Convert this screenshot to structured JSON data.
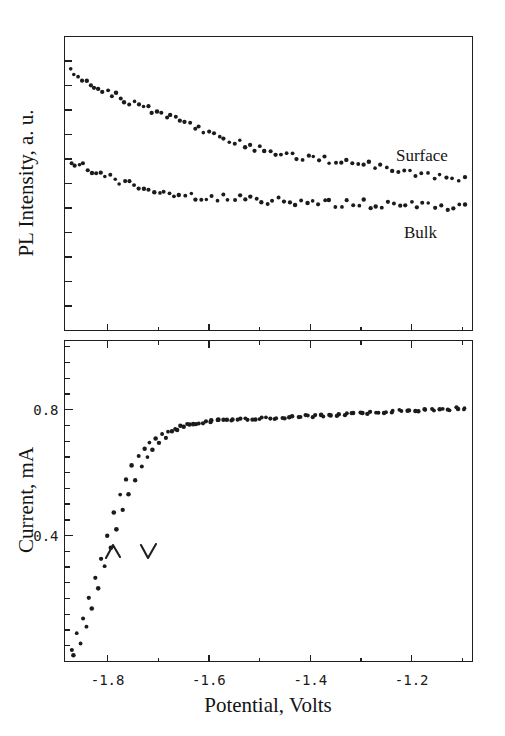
{
  "figure": {
    "background": "#ffffff",
    "ink_color": "#1b1b1b"
  },
  "panels": {
    "top": {
      "name": "PL intensity panel",
      "ylabel": "PL Intensity, a. u.",
      "series_labels": {
        "surface": "Surface",
        "bulk": "Bulk"
      },
      "y_ticks_labeled": false
    },
    "bottom": {
      "name": "Current panel",
      "ylabel": "Current, mA",
      "xlabel": "Potential, Volts",
      "y_tick_labels": [
        "0.8",
        "0.4"
      ],
      "x_tick_labels": [
        "-1.8",
        "-1.6",
        "-1.4",
        "-1.2"
      ],
      "scan_marks": {
        "forward": "∧",
        "reverse": "∨"
      }
    }
  },
  "chart_data": [
    {
      "type": "scatter",
      "title": "",
      "xlabel": "",
      "ylabel": "PL Intensity, a. u.",
      "xlim": [
        -1.885,
        -1.08
      ],
      "ylim": [
        0,
        1
      ],
      "xticks": [
        -1.8,
        -1.6,
        -1.4,
        -1.2
      ],
      "xticklabels": [
        "",
        "",
        "",
        ""
      ],
      "yticks": [],
      "yticklabels": [],
      "grid": false,
      "legend_position": "inline-annotation",
      "series": [
        {
          "name": "Surface",
          "annotation": "Surface",
          "x": [
            -1.872,
            -1.866,
            -1.858,
            -1.85,
            -1.842,
            -1.834,
            -1.826,
            -1.818,
            -1.81,
            -1.8,
            -1.792,
            -1.784,
            -1.774,
            -1.766,
            -1.756,
            -1.748,
            -1.738,
            -1.73,
            -1.72,
            -1.712,
            -1.702,
            -1.694,
            -1.684,
            -1.676,
            -1.666,
            -1.656,
            -1.648,
            -1.638,
            -1.628,
            -1.62,
            -1.61,
            -1.6,
            -1.59,
            -1.58,
            -1.57,
            -1.56,
            -1.55,
            -1.54,
            -1.53,
            -1.52,
            -1.51,
            -1.5,
            -1.49,
            -1.478,
            -1.468,
            -1.458,
            -1.448,
            -1.436,
            -1.426,
            -1.416,
            -1.404,
            -1.394,
            -1.384,
            -1.372,
            -1.362,
            -1.35,
            -1.34,
            -1.328,
            -1.318,
            -1.306,
            -1.296,
            -1.284,
            -1.272,
            -1.262,
            -1.25,
            -1.238,
            -1.226,
            -1.216,
            -1.204,
            -1.192,
            -1.18,
            -1.168,
            -1.156,
            -1.144,
            -1.132,
            -1.12,
            -1.108,
            -1.096
          ],
          "y": [
            0.88,
            0.872,
            0.868,
            0.86,
            0.848,
            0.844,
            0.836,
            0.826,
            0.818,
            0.812,
            0.806,
            0.798,
            0.79,
            0.782,
            0.778,
            0.772,
            0.766,
            0.76,
            0.754,
            0.748,
            0.742,
            0.738,
            0.73,
            0.726,
            0.72,
            0.712,
            0.706,
            0.7,
            0.694,
            0.688,
            0.68,
            0.674,
            0.668,
            0.66,
            0.654,
            0.648,
            0.642,
            0.636,
            0.632,
            0.626,
            0.62,
            0.616,
            0.612,
            0.606,
            0.602,
            0.598,
            0.596,
            0.592,
            0.59,
            0.588,
            0.586,
            0.584,
            0.582,
            0.582,
            0.58,
            0.578,
            0.578,
            0.576,
            0.574,
            0.572,
            0.568,
            0.564,
            0.56,
            0.556,
            0.552,
            0.548,
            0.544,
            0.542,
            0.538,
            0.534,
            0.53,
            0.528,
            0.524,
            0.522,
            0.518,
            0.516,
            0.514,
            0.512
          ]
        },
        {
          "name": "Bulk",
          "annotation": "Bulk",
          "x": [
            -1.872,
            -1.864,
            -1.856,
            -1.848,
            -1.84,
            -1.83,
            -1.822,
            -1.812,
            -1.804,
            -1.794,
            -1.786,
            -1.776,
            -1.766,
            -1.758,
            -1.748,
            -1.738,
            -1.728,
            -1.718,
            -1.708,
            -1.698,
            -1.688,
            -1.678,
            -1.668,
            -1.658,
            -1.648,
            -1.636,
            -1.626,
            -1.616,
            -1.604,
            -1.594,
            -1.584,
            -1.572,
            -1.562,
            -1.55,
            -1.54,
            -1.528,
            -1.518,
            -1.506,
            -1.496,
            -1.484,
            -1.474,
            -1.462,
            -1.452,
            -1.44,
            -1.43,
            -1.418,
            -1.406,
            -1.396,
            -1.384,
            -1.372,
            -1.362,
            -1.35,
            -1.338,
            -1.328,
            -1.316,
            -1.304,
            -1.294,
            -1.282,
            -1.27,
            -1.258,
            -1.248,
            -1.236,
            -1.224,
            -1.212,
            -1.2,
            -1.19,
            -1.178,
            -1.166,
            -1.154,
            -1.142,
            -1.13,
            -1.118,
            -1.106,
            -1.096
          ],
          "y": [
            0.572,
            0.566,
            0.56,
            0.556,
            0.548,
            0.544,
            0.536,
            0.53,
            0.524,
            0.52,
            0.512,
            0.508,
            0.502,
            0.498,
            0.494,
            0.49,
            0.486,
            0.482,
            0.478,
            0.474,
            0.472,
            0.468,
            0.466,
            0.462,
            0.46,
            0.458,
            0.456,
            0.454,
            0.452,
            0.452,
            0.45,
            0.45,
            0.448,
            0.448,
            0.446,
            0.446,
            0.444,
            0.444,
            0.444,
            0.442,
            0.442,
            0.442,
            0.44,
            0.44,
            0.44,
            0.438,
            0.438,
            0.438,
            0.436,
            0.436,
            0.436,
            0.434,
            0.434,
            0.434,
            0.432,
            0.432,
            0.432,
            0.43,
            0.43,
            0.43,
            0.428,
            0.428,
            0.428,
            0.426,
            0.426,
            0.426,
            0.424,
            0.424,
            0.424,
            0.422,
            0.422,
            0.422,
            0.42,
            0.42
          ]
        }
      ]
    },
    {
      "type": "scatter",
      "title": "",
      "xlabel": "Potential, Volts",
      "ylabel": "Current, mA",
      "xlim": [
        -1.885,
        -1.08
      ],
      "ylim": [
        0.0,
        1.02
      ],
      "xticks": [
        -1.8,
        -1.6,
        -1.4,
        -1.2
      ],
      "xticklabels": [
        "-1.8",
        "-1.6",
        "-1.4",
        "-1.2"
      ],
      "yticks": [
        0.4,
        0.8
      ],
      "yticklabels": [
        "0.4",
        "0.8"
      ],
      "grid": false,
      "legend_position": "none",
      "series": [
        {
          "name": "forward scan",
          "annotation": "∧",
          "x": [
            -1.872,
            -1.86,
            -1.848,
            -1.836,
            -1.824,
            -1.812,
            -1.8,
            -1.788,
            -1.776,
            -1.764,
            -1.752,
            -1.74,
            -1.728,
            -1.716,
            -1.704,
            -1.692,
            -1.68,
            -1.668,
            -1.656,
            -1.644,
            -1.632,
            -1.62,
            -1.606,
            -1.594,
            -1.58,
            -1.566,
            -1.552,
            -1.538,
            -1.524,
            -1.51,
            -1.496,
            -1.48,
            -1.466,
            -1.45,
            -1.436,
            -1.42,
            -1.406,
            -1.39,
            -1.374,
            -1.36,
            -1.344,
            -1.328,
            -1.314,
            -1.298,
            -1.282,
            -1.266,
            -1.25,
            -1.236,
            -1.22,
            -1.204,
            -1.188,
            -1.172,
            -1.156,
            -1.14,
            -1.124,
            -1.108,
            -1.096
          ],
          "y": [
            0.04,
            0.09,
            0.14,
            0.2,
            0.268,
            0.33,
            0.398,
            0.47,
            0.528,
            0.58,
            0.62,
            0.652,
            0.678,
            0.698,
            0.712,
            0.722,
            0.732,
            0.74,
            0.748,
            0.752,
            0.756,
            0.76,
            0.762,
            0.764,
            0.766,
            0.768,
            0.768,
            0.77,
            0.77,
            0.772,
            0.772,
            0.774,
            0.774,
            0.776,
            0.776,
            0.778,
            0.778,
            0.78,
            0.782,
            0.782,
            0.784,
            0.786,
            0.786,
            0.788,
            0.79,
            0.79,
            0.792,
            0.794,
            0.794,
            0.796,
            0.796,
            0.798,
            0.798,
            0.8,
            0.8,
            0.802,
            0.802
          ]
        },
        {
          "name": "reverse scan",
          "annotation": "∨",
          "x": [
            -1.866,
            -1.854,
            -1.842,
            -1.83,
            -1.818,
            -1.806,
            -1.794,
            -1.782,
            -1.77,
            -1.758,
            -1.746,
            -1.734,
            -1.722,
            -1.71,
            -1.698,
            -1.686,
            -1.674,
            -1.662,
            -1.65,
            -1.638,
            -1.626,
            -1.612,
            -1.598,
            -1.584,
            -1.57,
            -1.556,
            -1.542,
            -1.528,
            -1.514,
            -1.5,
            -1.486,
            -1.47,
            -1.456,
            -1.44,
            -1.424,
            -1.41,
            -1.394,
            -1.378,
            -1.364,
            -1.348,
            -1.332,
            -1.318,
            -1.302,
            -1.286,
            -1.27,
            -1.254,
            -1.24,
            -1.224,
            -1.208,
            -1.192,
            -1.176,
            -1.16,
            -1.144,
            -1.128,
            -1.112,
            -1.096
          ],
          "y": [
            0.02,
            0.056,
            0.11,
            0.17,
            0.232,
            0.3,
            0.36,
            0.42,
            0.48,
            0.532,
            0.576,
            0.616,
            0.65,
            0.676,
            0.698,
            0.714,
            0.728,
            0.738,
            0.746,
            0.752,
            0.756,
            0.76,
            0.762,
            0.764,
            0.766,
            0.768,
            0.77,
            0.77,
            0.772,
            0.772,
            0.774,
            0.774,
            0.776,
            0.778,
            0.778,
            0.78,
            0.78,
            0.782,
            0.784,
            0.784,
            0.786,
            0.788,
            0.788,
            0.79,
            0.792,
            0.792,
            0.794,
            0.796,
            0.796,
            0.798,
            0.8,
            0.8,
            0.802,
            0.802,
            0.804,
            0.804
          ]
        }
      ]
    }
  ]
}
